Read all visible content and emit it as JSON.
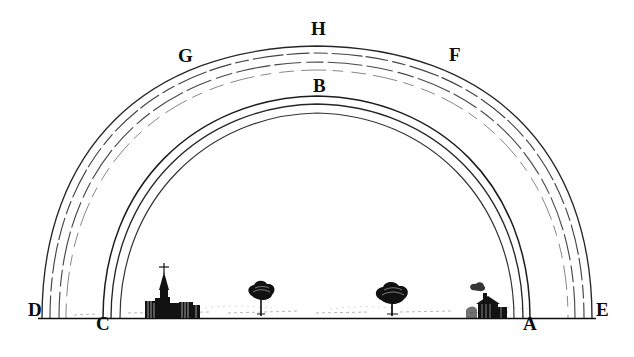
{
  "figure": {
    "kind": "engraved optical diagram",
    "background_color": "#ffffff",
    "ink_color": "#111111",
    "width": 634,
    "height": 357
  },
  "labels": {
    "apex_outer": "H",
    "left_outer": "G",
    "right_outer": "F",
    "apex_inner": "B",
    "left_ground_outer": "D",
    "left_ground_inner": "C",
    "right_ground_inner": "A",
    "right_ground_outer": "E"
  },
  "arcs": {
    "secondary": {
      "name": "secondary-rainbow-arc",
      "left_foot_label": "D",
      "right_foot_label": "E",
      "apex_label": "H",
      "left_shoulder_label": "G",
      "right_shoulder_label": "F",
      "band_count": 3,
      "style": "faint dashed at apex, solid near feet"
    },
    "primary": {
      "name": "primary-rainbow-arc",
      "left_foot_label": "C",
      "right_foot_label": "A",
      "apex_label": "B",
      "band_count": 3,
      "style": "solid dark"
    }
  },
  "ground": {
    "name": "horizon-line",
    "features": [
      {
        "type": "village-with-church",
        "label": "village"
      },
      {
        "type": "tree",
        "label": "tree"
      },
      {
        "type": "tree",
        "label": "tree"
      },
      {
        "type": "cottage-with-smoke",
        "label": "cottage"
      }
    ]
  }
}
